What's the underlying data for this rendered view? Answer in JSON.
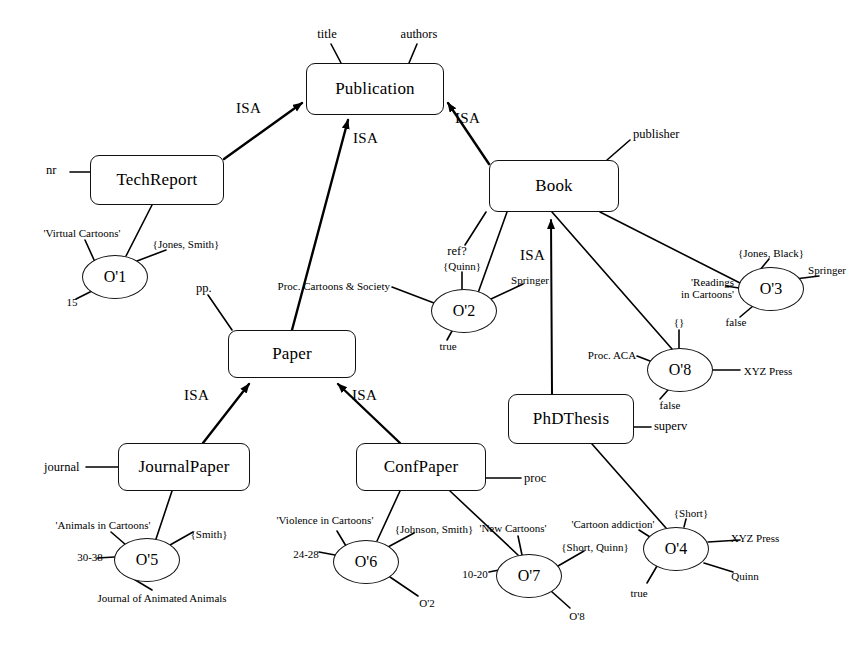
{
  "diagram": {
    "ink_color": "#000000",
    "background": "#ffffff",
    "isa_label": "ISA",
    "classes": [
      {
        "id": "publication",
        "name": "Publication",
        "x": 306,
        "y": 63,
        "w": 138,
        "h": 52
      },
      {
        "id": "techreport",
        "name": "TechReport",
        "x": 90,
        "y": 155,
        "w": 134,
        "h": 50
      },
      {
        "id": "book",
        "name": "Book",
        "x": 489,
        "y": 160,
        "w": 130,
        "h": 52
      },
      {
        "id": "paper",
        "name": "Paper",
        "x": 228,
        "y": 330,
        "w": 128,
        "h": 48
      },
      {
        "id": "phdthesis",
        "name": "PhDThesis",
        "x": 508,
        "y": 394,
        "w": 126,
        "h": 50
      },
      {
        "id": "journalpaper",
        "name": "JournalPaper",
        "x": 118,
        "y": 443,
        "w": 132,
        "h": 48
      },
      {
        "id": "confpaper",
        "name": "ConfPaper",
        "x": 356,
        "y": 443,
        "w": 130,
        "h": 48
      }
    ],
    "instances": [
      {
        "id": "o1",
        "name": "O'1",
        "cx": 115,
        "cy": 277,
        "rx": 33,
        "ry": 22
      },
      {
        "id": "o2",
        "name": "O'2",
        "cx": 464,
        "cy": 311,
        "rx": 33,
        "ry": 22
      },
      {
        "id": "o3",
        "name": "O'3",
        "cx": 771,
        "cy": 289,
        "rx": 33,
        "ry": 22
      },
      {
        "id": "o8",
        "name": "O'8",
        "cx": 680,
        "cy": 370,
        "rx": 33,
        "ry": 22
      },
      {
        "id": "o5",
        "name": "O'5",
        "cx": 147,
        "cy": 560,
        "rx": 33,
        "ry": 22
      },
      {
        "id": "o6",
        "name": "O'6",
        "cx": 366,
        "cy": 562,
        "rx": 33,
        "ry": 22
      },
      {
        "id": "o7",
        "name": "O'7",
        "cx": 529,
        "cy": 576,
        "rx": 33,
        "ry": 22
      },
      {
        "id": "o4",
        "name": "O'4",
        "cx": 676,
        "cy": 549,
        "rx": 33,
        "ry": 22
      }
    ],
    "attributes": [
      {
        "id": "att-title",
        "text": "title",
        "x": 327,
        "y": 33,
        "align": "c",
        "owner": "publication"
      },
      {
        "id": "att-authors",
        "text": "authors",
        "x": 419,
        "y": 33,
        "align": "c",
        "owner": "publication"
      },
      {
        "id": "att-nr",
        "text": "nr",
        "x": 52,
        "y": 168,
        "align": "l",
        "owner": "techreport"
      },
      {
        "id": "att-publisher",
        "text": "publisher",
        "x": 633,
        "y": 133,
        "align": "l",
        "owner": "book"
      },
      {
        "id": "att-ref",
        "text": "ref?",
        "x": 455,
        "y": 250,
        "align": "c",
        "owner": "book"
      },
      {
        "id": "att-pp",
        "text": "pp.",
        "x": 200,
        "y": 287,
        "align": "l",
        "owner": "paper"
      },
      {
        "id": "att-superv",
        "text": "superv",
        "x": 653,
        "y": 430,
        "align": "l",
        "owner": "phdthesis"
      },
      {
        "id": "att-journal",
        "text": "journal",
        "x": 48,
        "y": 468,
        "align": "l",
        "owner": "journalpaper"
      },
      {
        "id": "att-proc",
        "text": "proc",
        "x": 524,
        "y": 481,
        "align": "l",
        "owner": "confpaper"
      }
    ],
    "isa_links": [
      {
        "id": "isa-techreport-publication",
        "label": "ISA",
        "lx": 240,
        "ly": 106
      },
      {
        "id": "isa-paper-publication",
        "label": "ISA",
        "lx": 360,
        "ly": 136
      },
      {
        "id": "isa-book-publication",
        "label": "ISA",
        "lx": 459,
        "ly": 113
      },
      {
        "id": "isa-phdthesis-book",
        "label": "ISA",
        "lx": 527,
        "ly": 253
      },
      {
        "id": "isa-journalpaper-paper",
        "label": "ISA",
        "lx": 190,
        "ly": 392
      },
      {
        "id": "isa-confpaper-paper",
        "label": "ISA",
        "lx": 358,
        "ly": 392
      }
    ],
    "values": [
      {
        "id": "v-o1-title",
        "text": "'Virtual Cartoons'",
        "x": 82,
        "y": 232,
        "align": "c",
        "owner": "o1"
      },
      {
        "id": "v-o1-authors",
        "text": "{Jones, Smith}",
        "x": 186,
        "y": 243,
        "align": "c",
        "owner": "o1"
      },
      {
        "id": "v-o1-nr",
        "text": "15",
        "x": 72,
        "y": 301,
        "align": "c",
        "owner": "o1"
      },
      {
        "id": "v-o2-proc",
        "text": "Proc. Cartoons & Society",
        "x": 386,
        "y": 285,
        "align": "r",
        "owner": "o2"
      },
      {
        "id": "v-o2-authors",
        "text": "{Quinn}",
        "x": 462,
        "y": 265,
        "align": "c",
        "owner": "o2"
      },
      {
        "id": "v-o2-pub",
        "text": "Springer",
        "x": 530,
        "y": 279,
        "align": "c",
        "owner": "o2"
      },
      {
        "id": "v-o2-ref",
        "text": "true",
        "x": 448,
        "y": 344,
        "align": "c",
        "owner": "o2"
      },
      {
        "id": "v-o3-authors",
        "text": "{Jones, Black}",
        "x": 771,
        "y": 252,
        "align": "c",
        "owner": "o3"
      },
      {
        "id": "v-o3-pub",
        "text": "Springer",
        "x": 827,
        "y": 269,
        "align": "c",
        "owner": "o3"
      },
      {
        "id": "v-o3-title",
        "text": "'Readings\nin Cartoons'",
        "x": 717,
        "y": 281,
        "align": "c",
        "owner": "o3"
      },
      {
        "id": "v-o3-ref",
        "text": "false",
        "x": 736,
        "y": 321,
        "align": "c",
        "owner": "o3"
      },
      {
        "id": "v-o8-authors",
        "text": "{}",
        "x": 679,
        "y": 322,
        "align": "c",
        "owner": "o8"
      },
      {
        "id": "v-o8-title",
        "text": "Proc. ACA",
        "x": 615,
        "y": 354,
        "align": "c",
        "owner": "o8"
      },
      {
        "id": "v-o8-pub",
        "text": "XYZ Press",
        "x": 765,
        "y": 371,
        "align": "c",
        "owner": "o8"
      },
      {
        "id": "v-o8-ref",
        "text": "false",
        "x": 670,
        "y": 404,
        "align": "c",
        "owner": "o8"
      },
      {
        "id": "v-o5-title",
        "text": "'Animals in Cartoons'",
        "x": 103,
        "y": 524,
        "align": "c",
        "owner": "o5"
      },
      {
        "id": "v-o5-authors",
        "text": "{Smith}",
        "x": 208,
        "y": 533,
        "align": "c",
        "owner": "o5"
      },
      {
        "id": "v-o5-pp",
        "text": "30-38",
        "x": 92,
        "y": 556,
        "align": "c",
        "owner": "o5"
      },
      {
        "id": "v-o5-journal",
        "text": "Journal of Animated Animals",
        "x": 160,
        "y": 597,
        "align": "c",
        "owner": "o5"
      },
      {
        "id": "v-o6-title",
        "text": "'Violence in Cartoons'",
        "x": 327,
        "y": 519,
        "align": "c",
        "owner": "o6"
      },
      {
        "id": "v-o6-authors",
        "text": "{Johnson, Smith}",
        "x": 433,
        "y": 528,
        "align": "c",
        "owner": "o6"
      },
      {
        "id": "v-o6-pp",
        "text": "24-28",
        "x": 308,
        "y": 553,
        "align": "c",
        "owner": "o6"
      },
      {
        "id": "v-o6-proc",
        "text": "O'2",
        "x": 427,
        "y": 602,
        "align": "c",
        "owner": "o6"
      },
      {
        "id": "v-o7-title",
        "text": "'New Cartoons'",
        "x": 514,
        "y": 527,
        "align": "c",
        "owner": "o7"
      },
      {
        "id": "v-o7-authors",
        "text": "{Short, Quinn}",
        "x": 594,
        "y": 546,
        "align": "c",
        "owner": "o7"
      },
      {
        "id": "v-o7-pp",
        "text": "10-20",
        "x": 477,
        "y": 573,
        "align": "c",
        "owner": "o7"
      },
      {
        "id": "v-o7-proc",
        "text": "O'8",
        "x": 577,
        "y": 615,
        "align": "c",
        "owner": "o7"
      },
      {
        "id": "v-o4-title",
        "text": "'Cartoon addiction'",
        "x": 613,
        "y": 523,
        "align": "c",
        "owner": "o4"
      },
      {
        "id": "v-o4-authors",
        "text": "{Short}",
        "x": 691,
        "y": 512,
        "align": "c",
        "owner": "o4"
      },
      {
        "id": "v-o4-pub",
        "text": "XYZ Press",
        "x": 752,
        "y": 537,
        "align": "c",
        "owner": "o4"
      },
      {
        "id": "v-o4-superv",
        "text": "Quinn",
        "x": 745,
        "y": 575,
        "align": "c",
        "owner": "o4"
      },
      {
        "id": "v-o4-ref",
        "text": "true",
        "x": 639,
        "y": 592,
        "align": "c",
        "owner": "o4"
      }
    ]
  }
}
